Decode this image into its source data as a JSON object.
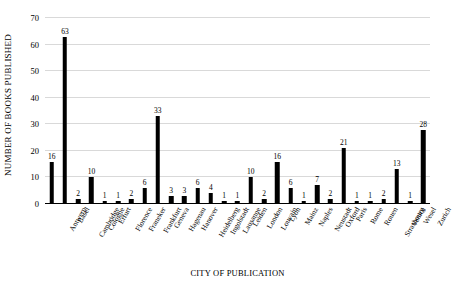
{
  "chart_data": {
    "type": "bar",
    "title": "",
    "xlabel": "CITY OF PUBLICATION",
    "ylabel": "NUMBER OF BOOKS PUBLISHED",
    "ylim": [
      0,
      70
    ],
    "ytick_step": 10,
    "yticks": [
      0,
      10,
      20,
      30,
      40,
      50,
      60,
      70
    ],
    "grid": true,
    "legend": false,
    "bar_color": "#000000",
    "gridline_color": "#D9D9D9",
    "data_labels": true,
    "categories": [
      "Antwerp",
      "Basel",
      "Cambridge",
      "Cologne",
      "Erfurt",
      "Florence",
      "Franeker",
      "Frankfurt",
      "Geneva",
      "Hagenau",
      "Hanover",
      "Heidelberg",
      "Ingolstadt",
      "Lausanne",
      "Leiden",
      "London",
      "Louvain",
      "Lyon",
      "Mainz",
      "Naples",
      "Neustadt",
      "Oxford",
      "Paris",
      "Rome",
      "Rouen",
      "Strasbourg",
      "Venice",
      "Wesel",
      "Zurich"
    ],
    "values": [
      16,
      63,
      2,
      10,
      1,
      1,
      2,
      6,
      33,
      3,
      3,
      6,
      4,
      1,
      1,
      10,
      2,
      16,
      6,
      1,
      7,
      2,
      21,
      1,
      1,
      2,
      13,
      1,
      28
    ]
  }
}
